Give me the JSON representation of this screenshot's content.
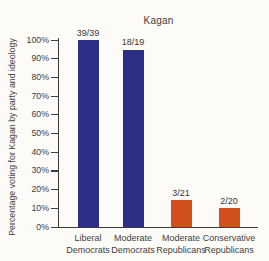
{
  "figure": {
    "title": "Kagan",
    "y_axis_label": "Percentage voting for Kagan by party and ideology"
  },
  "chart_data": {
    "type": "bar",
    "title": "Kagan",
    "xlabel": "",
    "ylabel": "Percentage voting for Kagan by party and ideology",
    "ylim": [
      0,
      100
    ],
    "grid": false,
    "legend": "none",
    "yticks": [
      "0%",
      "10%",
      "20%",
      "30%",
      "40%",
      "50%",
      "60%",
      "70%",
      "80%",
      "90%",
      "100%"
    ],
    "categories": [
      "Liberal Democrats",
      "Moderate Democrats",
      "Moderate Republicans",
      "Conservative Republicans"
    ],
    "category_lines": [
      [
        "Liberal",
        "Democrats"
      ],
      [
        "Moderate",
        "Democrats"
      ],
      [
        "Moderate",
        "Republicans"
      ],
      [
        "Conservative",
        "Republicans"
      ]
    ],
    "values": [
      100,
      94.7,
      14.3,
      10
    ],
    "bar_labels": [
      "39/39",
      "18/19",
      "3/21",
      "2/20"
    ],
    "bar_colors": [
      "#2b2f85",
      "#2b2f85",
      "#d2501e",
      "#d2501e"
    ],
    "colors": {
      "democrat_bar": "#2b2f85",
      "republican_bar": "#d2501e",
      "axis": "#3d3d3d",
      "text": "#3d3d3d",
      "background": "#fcfbf7"
    }
  }
}
